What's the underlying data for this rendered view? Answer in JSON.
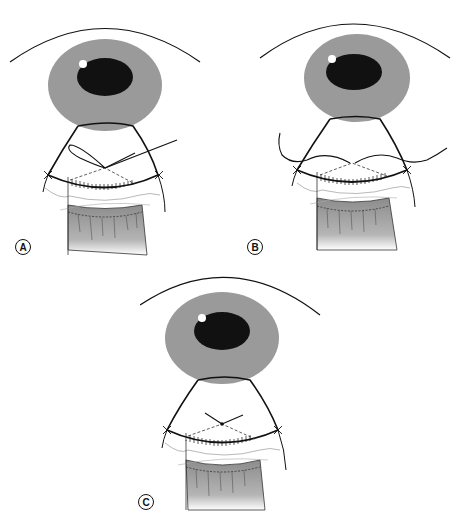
{
  "figure": {
    "panels": [
      {
        "id": "A",
        "label": "A",
        "suture_state": "needle passed, loop open"
      },
      {
        "id": "B",
        "label": "B",
        "suture_state": "suture ends pulled laterally"
      },
      {
        "id": "C",
        "label": "C",
        "suture_state": "suture tied"
      }
    ],
    "colors": {
      "iris": "#9a9a9a",
      "pupil": "#111111",
      "highlight": "#ffffff",
      "outline": "#111111",
      "muscle_shade": "#8c8c8c",
      "background": "#ffffff"
    }
  }
}
